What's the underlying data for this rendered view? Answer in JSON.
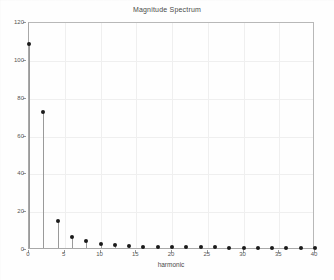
{
  "figure": {
    "background_color": "#fefefe",
    "axis_color": "#a8a8a8",
    "grid_color": "#efefef",
    "marker_color": "#1a1a1a",
    "stem_color": "#9a9a9a"
  },
  "chart_data": {
    "type": "scatter",
    "plot_style": "stem",
    "title": "Magnitude Spectrum",
    "xlabel": "harmonic",
    "ylabel": "",
    "xlim": [
      0,
      40
    ],
    "ylim": [
      0,
      120
    ],
    "grid": true,
    "legend": null,
    "xticks": [
      0,
      5,
      10,
      15,
      20,
      25,
      30,
      35,
      40
    ],
    "xtick_labels": [
      "0",
      "5",
      "10",
      "15",
      "20",
      "25",
      "30",
      "35",
      "40"
    ],
    "yticks": [
      0,
      20,
      40,
      60,
      80,
      100,
      120
    ],
    "ytick_labels": [
      "0",
      "20",
      "40",
      "60",
      "80",
      "100",
      "120"
    ],
    "x": [
      0,
      2,
      4,
      6,
      8,
      10,
      12,
      14,
      16,
      18,
      20,
      22,
      24,
      26,
      28,
      30,
      32,
      34,
      36,
      38,
      40
    ],
    "values": [
      108,
      72,
      14.5,
      6,
      3.5,
      2.2,
      1.4,
      1.0,
      0.8,
      0.6,
      0.5,
      0.4,
      0.35,
      0.3,
      0.25,
      0.2,
      0.2,
      0.15,
      0.15,
      0.1,
      0.1
    ]
  }
}
